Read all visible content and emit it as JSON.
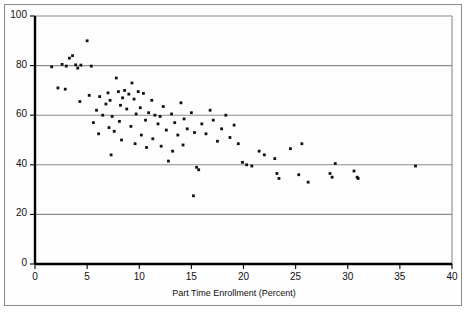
{
  "chart_data": {
    "type": "scatter",
    "title": "",
    "xlabel": "Part Time Enrollment (Percent)",
    "ylabel": "",
    "xlim": [
      0,
      40
    ],
    "ylim": [
      0,
      100
    ],
    "xticks": [
      0,
      5,
      10,
      15,
      20,
      25,
      30,
      35,
      40
    ],
    "yticks": [
      0,
      20,
      40,
      60,
      80,
      100
    ],
    "grid": "horizontal",
    "legend": "none",
    "marker_color": "#111111",
    "gridline_color": "#8c8c8c",
    "axis_color": "#000000",
    "points": [
      [
        1.6,
        79.5
      ],
      [
        2.2,
        71.0
      ],
      [
        2.6,
        80.5
      ],
      [
        3.0,
        79.8
      ],
      [
        3.3,
        83.0
      ],
      [
        3.6,
        84.0
      ],
      [
        3.9,
        80.3
      ],
      [
        4.1,
        79.0
      ],
      [
        4.4,
        80.2
      ],
      [
        5.4,
        79.8
      ],
      [
        5.0,
        90.0
      ],
      [
        2.9,
        70.5
      ],
      [
        4.3,
        65.5
      ],
      [
        5.2,
        68.0
      ],
      [
        5.6,
        57.0
      ],
      [
        5.9,
        62.0
      ],
      [
        6.2,
        67.5
      ],
      [
        6.5,
        60.0
      ],
      [
        6.1,
        52.5
      ],
      [
        6.8,
        64.5
      ],
      [
        7.0,
        69.0
      ],
      [
        7.2,
        66.0
      ],
      [
        7.4,
        59.5
      ],
      [
        7.1,
        55.0
      ],
      [
        7.6,
        53.5
      ],
      [
        7.3,
        44.0
      ],
      [
        7.8,
        75.0
      ],
      [
        8.0,
        69.5
      ],
      [
        8.2,
        64.0
      ],
      [
        8.4,
        67.0
      ],
      [
        8.6,
        70.0
      ],
      [
        8.1,
        57.5
      ],
      [
        8.8,
        62.5
      ],
      [
        8.3,
        50.0
      ],
      [
        9.0,
        68.5
      ],
      [
        9.3,
        73.0
      ],
      [
        9.5,
        66.5
      ],
      [
        9.7,
        60.5
      ],
      [
        9.2,
        55.5
      ],
      [
        9.9,
        69.5
      ],
      [
        9.6,
        48.5
      ],
      [
        10.1,
        63.0
      ],
      [
        10.4,
        68.8
      ],
      [
        10.6,
        58.0
      ],
      [
        10.2,
        52.0
      ],
      [
        10.9,
        61.0
      ],
      [
        10.7,
        47.0
      ],
      [
        11.2,
        66.0
      ],
      [
        11.5,
        60.0
      ],
      [
        11.8,
        56.5
      ],
      [
        11.3,
        50.5
      ],
      [
        12.0,
        59.5
      ],
      [
        12.3,
        63.5
      ],
      [
        12.6,
        54.0
      ],
      [
        12.1,
        47.5
      ],
      [
        12.8,
        41.5
      ],
      [
        13.1,
        60.5
      ],
      [
        13.4,
        57.0
      ],
      [
        13.7,
        52.0
      ],
      [
        13.2,
        45.5
      ],
      [
        14.0,
        65.0
      ],
      [
        14.3,
        58.5
      ],
      [
        14.6,
        54.5
      ],
      [
        14.2,
        48.0
      ],
      [
        15.0,
        61.0
      ],
      [
        15.3,
        53.0
      ],
      [
        15.5,
        39.0
      ],
      [
        15.7,
        38.0
      ],
      [
        15.2,
        27.5
      ],
      [
        16.0,
        56.5
      ],
      [
        16.4,
        52.5
      ],
      [
        16.8,
        62.0
      ],
      [
        17.1,
        58.0
      ],
      [
        17.5,
        49.5
      ],
      [
        17.9,
        54.5
      ],
      [
        18.3,
        60.0
      ],
      [
        18.7,
        51.0
      ],
      [
        19.1,
        56.0
      ],
      [
        19.5,
        48.5
      ],
      [
        19.9,
        41.0
      ],
      [
        20.3,
        40.0
      ],
      [
        20.8,
        39.5
      ],
      [
        21.5,
        45.5
      ],
      [
        22.0,
        44.0
      ],
      [
        23.2,
        36.5
      ],
      [
        23.4,
        34.5
      ],
      [
        23.0,
        42.5
      ],
      [
        24.5,
        46.5
      ],
      [
        25.3,
        36.0
      ],
      [
        25.6,
        48.5
      ],
      [
        26.2,
        33.0
      ],
      [
        28.3,
        36.5
      ],
      [
        28.5,
        35.0
      ],
      [
        28.8,
        40.5
      ],
      [
        30.6,
        37.5
      ],
      [
        30.9,
        35.0
      ],
      [
        31.0,
        34.5
      ],
      [
        36.5,
        39.5
      ]
    ]
  }
}
